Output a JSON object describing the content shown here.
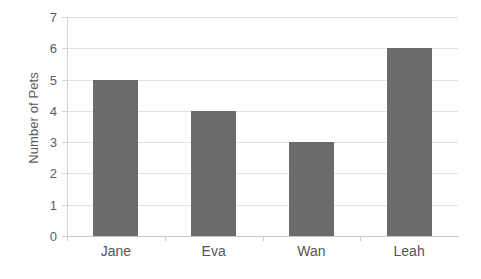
{
  "chart_data": {
    "type": "bar",
    "title": "",
    "xlabel": "",
    "ylabel": "Number of Pets",
    "categories": [
      "Jane",
      "Eva",
      "Wan",
      "Leah"
    ],
    "values": [
      5,
      4,
      3,
      6
    ],
    "ylim": [
      0,
      7
    ],
    "ytick_labels": [
      "0",
      "1",
      "2",
      "3",
      "4",
      "5",
      "6",
      "7"
    ],
    "ytick_values": [
      0,
      1,
      2,
      3,
      4,
      5,
      6,
      7
    ],
    "grid": "horizontal",
    "legend": "none",
    "series": [
      {
        "name": "Number of Pets",
        "values": [
          5,
          4,
          3,
          6
        ],
        "color": "#6b6b6b"
      }
    ],
    "colors": {
      "bar": "#6b6b6b",
      "gridline": "#e2e2e2",
      "axis": "#c9c9c9",
      "text": "#555555",
      "background": "#ffffff"
    }
  }
}
